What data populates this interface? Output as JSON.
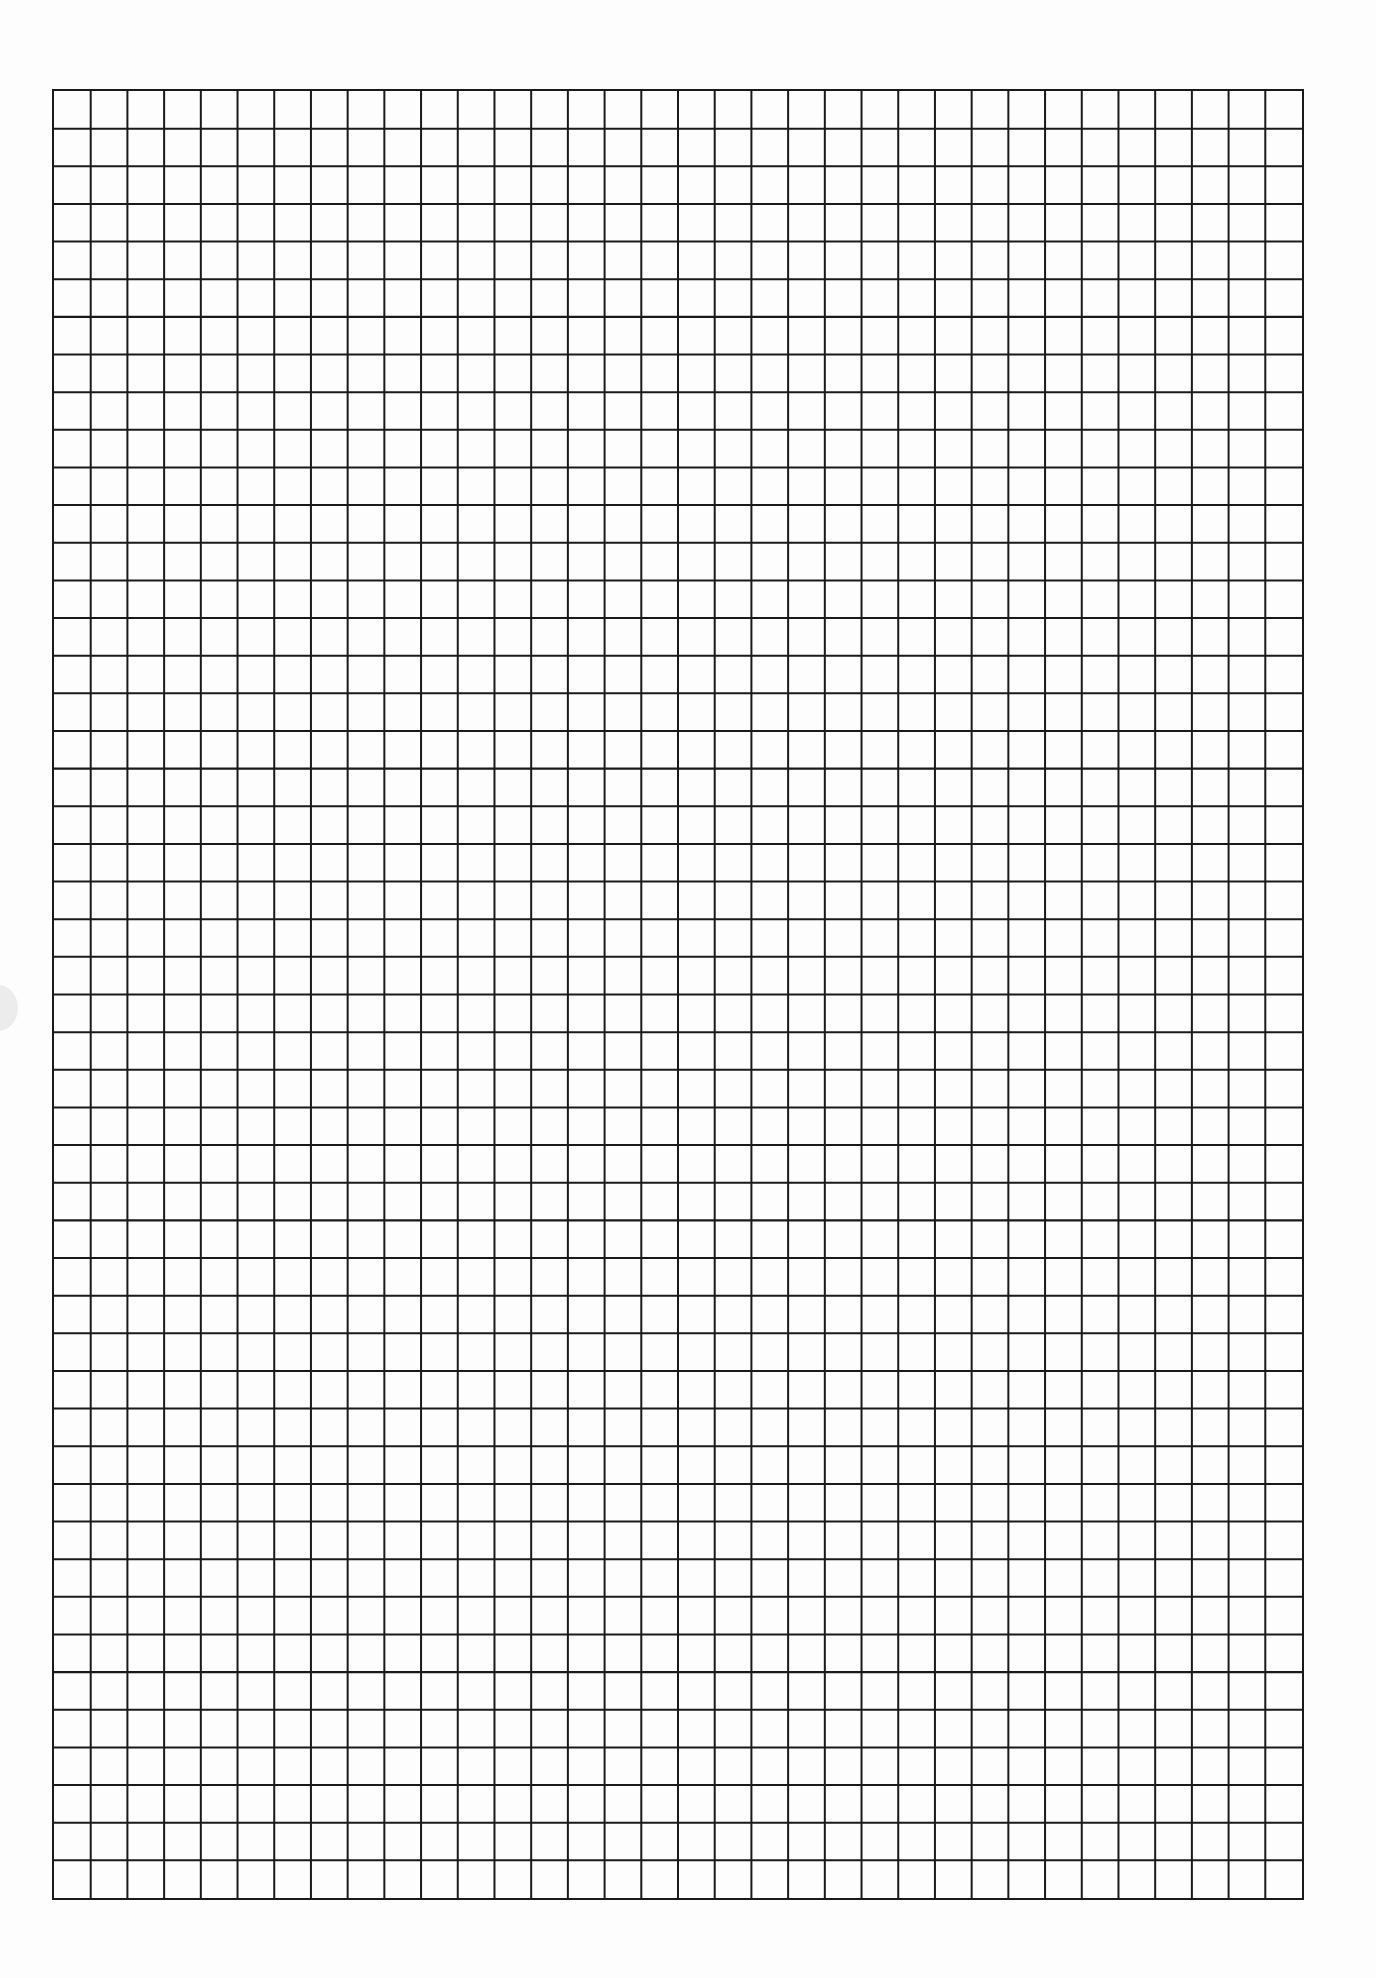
{
  "document": {
    "type": "graph-paper",
    "background_color": "#fdfdfd",
    "line_color": "#1a1a1a"
  },
  "grid": {
    "columns": 34,
    "rows": 48,
    "left": 52,
    "top": 89,
    "width": 1252,
    "height": 1811,
    "line_width": 2
  }
}
